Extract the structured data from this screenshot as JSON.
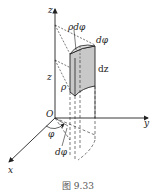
{
  "figure": {
    "caption": "图 9.33",
    "axes": {
      "z_label": "z",
      "y_label": "y",
      "x_label": "x",
      "origin_label": "O"
    },
    "annotations": {
      "rho_dphi": "ρdφ",
      "dphi_top": "dφ",
      "dz": "dz",
      "z_height": "z",
      "rho": "ρ",
      "phi": "φ",
      "dphi_bottom": "dφ"
    },
    "colors": {
      "line": "#222222",
      "shade": "#c8c8c8",
      "caption": "#555555"
    }
  }
}
